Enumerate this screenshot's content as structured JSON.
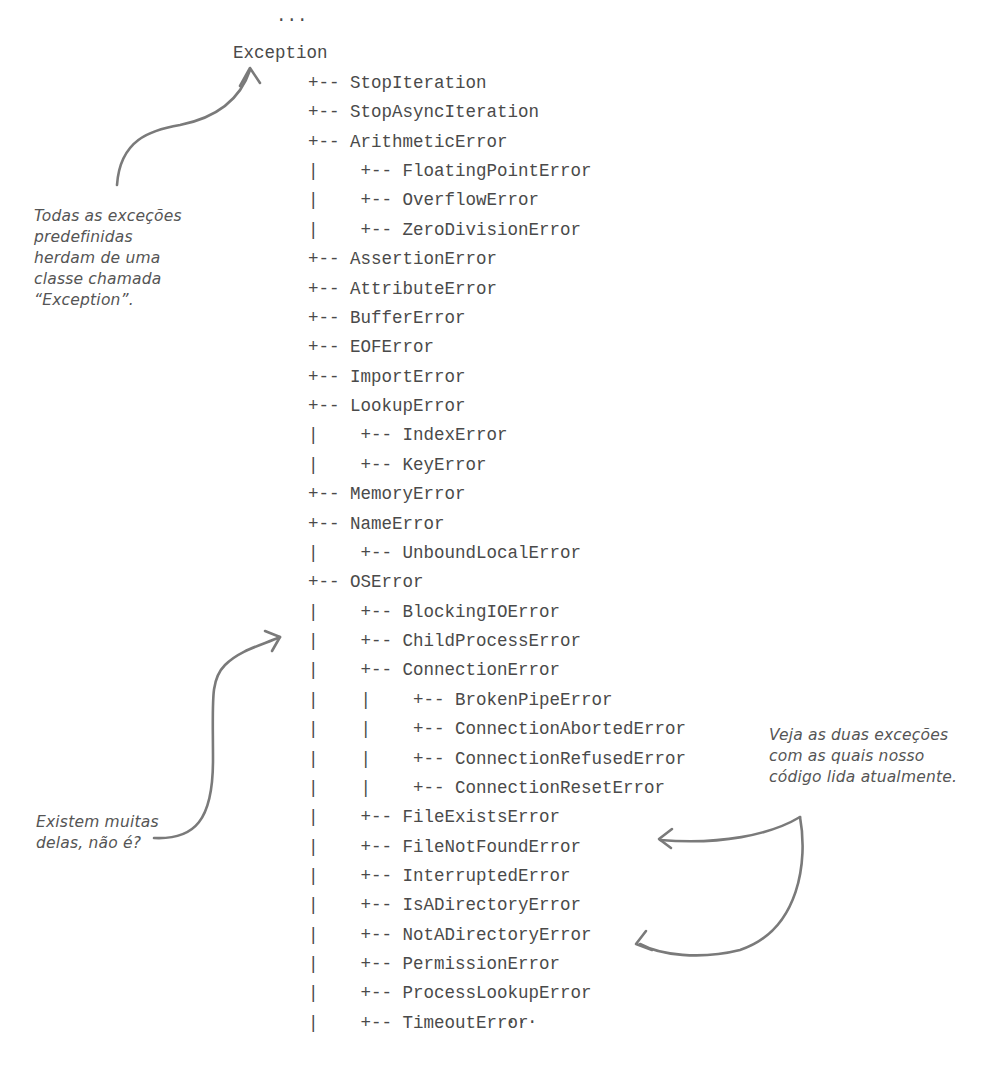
{
  "hierarchy": {
    "top_ellipsis": "...",
    "root": "Exception",
    "lines": [
      {
        "prefix": "+-- ",
        "name": "StopIteration",
        "depth": 0
      },
      {
        "prefix": "+-- ",
        "name": "StopAsyncIteration",
        "depth": 0
      },
      {
        "prefix": "+-- ",
        "name": "ArithmeticError",
        "depth": 0
      },
      {
        "prefix": "|    +-- ",
        "name": "FloatingPointError",
        "depth": 1
      },
      {
        "prefix": "|    +-- ",
        "name": "OverflowError",
        "depth": 1
      },
      {
        "prefix": "|    +-- ",
        "name": "ZeroDivisionError",
        "depth": 1
      },
      {
        "prefix": "+-- ",
        "name": "AssertionError",
        "depth": 0
      },
      {
        "prefix": "+-- ",
        "name": "AttributeError",
        "depth": 0
      },
      {
        "prefix": "+-- ",
        "name": "BufferError",
        "depth": 0
      },
      {
        "prefix": "+-- ",
        "name": "EOFError",
        "depth": 0
      },
      {
        "prefix": "+-- ",
        "name": "ImportError",
        "depth": 0
      },
      {
        "prefix": "+-- ",
        "name": "LookupError",
        "depth": 0
      },
      {
        "prefix": "|    +-- ",
        "name": "IndexError",
        "depth": 1
      },
      {
        "prefix": "|    +-- ",
        "name": "KeyError",
        "depth": 1
      },
      {
        "prefix": "+-- ",
        "name": "MemoryError",
        "depth": 0
      },
      {
        "prefix": "+-- ",
        "name": "NameError",
        "depth": 0
      },
      {
        "prefix": "|    +-- ",
        "name": "UnboundLocalError",
        "depth": 1
      },
      {
        "prefix": "+-- ",
        "name": "OSError",
        "depth": 0
      },
      {
        "prefix": "|    +-- ",
        "name": "BlockingIOError",
        "depth": 1
      },
      {
        "prefix": "|    +-- ",
        "name": "ChildProcessError",
        "depth": 1
      },
      {
        "prefix": "|    +-- ",
        "name": "ConnectionError",
        "depth": 1
      },
      {
        "prefix": "|    |    +-- ",
        "name": "BrokenPipeError",
        "depth": 2
      },
      {
        "prefix": "|    |    +-- ",
        "name": "ConnectionAbortedError",
        "depth": 2
      },
      {
        "prefix": "|    |    +-- ",
        "name": "ConnectionRefusedError",
        "depth": 2
      },
      {
        "prefix": "|    |    +-- ",
        "name": "ConnectionResetError",
        "depth": 2
      },
      {
        "prefix": "|    +-- ",
        "name": "FileExistsError",
        "depth": 1
      },
      {
        "prefix": "|    +-- ",
        "name": "FileNotFoundError",
        "depth": 1
      },
      {
        "prefix": "|    +-- ",
        "name": "InterruptedError",
        "depth": 1
      },
      {
        "prefix": "|    +-- ",
        "name": "IsADirectoryError",
        "depth": 1
      },
      {
        "prefix": "|    +-- ",
        "name": "NotADirectoryError",
        "depth": 1
      },
      {
        "prefix": "|    +-- ",
        "name": "PermissionError",
        "depth": 1
      },
      {
        "prefix": "|    +-- ",
        "name": "ProcessLookupError",
        "depth": 1
      },
      {
        "prefix": "|    +-- ",
        "name": "TimeoutError",
        "depth": 1
      }
    ],
    "bottom_ellipsis": "..."
  },
  "annotations": {
    "exception_base": "Todas as exceções\npredefinidas\nherdam de uma\nclasse chamada\n“Exception”.",
    "many_of_them": "Existem muitas\ndelas, não é?",
    "two_handled": "Veja as duas exceções\ncom as quais nosso\ncódigo lida atualmente."
  },
  "colors": {
    "text": "#4a4a4a",
    "handwriting": "#555555",
    "arrow": "#7a7a7a",
    "background": "#ffffff"
  }
}
